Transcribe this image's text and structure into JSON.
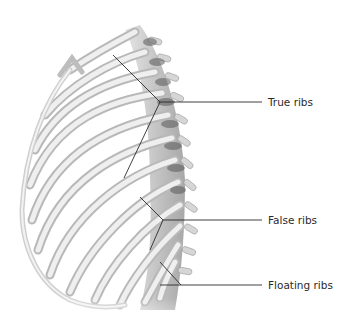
{
  "diagram": {
    "labels": [
      {
        "id": "true-ribs",
        "text": "True ribs"
      },
      {
        "id": "false-ribs",
        "text": "False ribs"
      },
      {
        "id": "floating-ribs",
        "text": "Floating ribs"
      }
    ],
    "colors": {
      "background": "#ffffff",
      "bone_light": "#ececec",
      "bone_mid": "#c9c9c9",
      "bone_dark": "#6e6e6e",
      "leader_line": "#2b2b2b",
      "label_text": "#2b2b2b"
    }
  }
}
